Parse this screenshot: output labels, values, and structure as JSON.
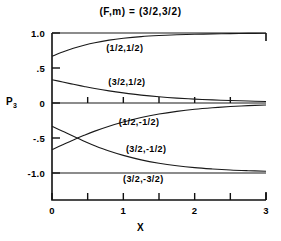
{
  "figure": {
    "title": "(F,m) = (3/2,3/2)",
    "y_axis_title": "P",
    "y_axis_title_sub": "3",
    "x_axis_title": "X"
  },
  "chart_data": {
    "type": "line",
    "title": "(F,m) = (3/2,3/2)",
    "xlabel": "X",
    "ylabel": "P3",
    "xlim": [
      0,
      3
    ],
    "ylim": [
      -1.15,
      1.05
    ],
    "grid": false,
    "legend": "inline-curve-labels",
    "xticks": [
      0,
      0.5,
      1,
      1.5,
      2,
      2.5,
      3
    ],
    "xticklabels": [
      "0",
      "",
      "1",
      "",
      "2",
      "",
      "3"
    ],
    "yticks": [
      1.0,
      0.5,
      0,
      -0.5,
      -1.0
    ],
    "yticklabels": [
      "1.0",
      ".5",
      "0",
      "-.5",
      "-1.0"
    ],
    "x": [
      0,
      0.15,
      0.3,
      0.45,
      0.6,
      0.8,
      1.0,
      1.25,
      1.5,
      1.75,
      2.0,
      2.25,
      2.5,
      2.75,
      3.0
    ],
    "series": [
      {
        "name": "(1/2,1/2)",
        "label": "(1/2,1/2)",
        "values": [
          0.667,
          0.728,
          0.781,
          0.825,
          0.861,
          0.898,
          0.924,
          0.948,
          0.964,
          0.975,
          0.982,
          0.987,
          0.991,
          0.994,
          0.996
        ],
        "label_x": 1.02,
        "label_y": 0.78
      },
      {
        "name": "(3/2,1/2)",
        "label": "(3/2,1/2)",
        "values": [
          0.333,
          0.3,
          0.267,
          0.236,
          0.207,
          0.173,
          0.144,
          0.113,
          0.089,
          0.07,
          0.055,
          0.044,
          0.035,
          0.028,
          0.022
        ],
        "label_x": 1.05,
        "label_y": 0.3
      },
      {
        "name": "(1/2,-1/2)",
        "label": "(1/2,-1/2)",
        "values": [
          -0.667,
          -0.596,
          -0.527,
          -0.462,
          -0.402,
          -0.332,
          -0.272,
          -0.208,
          -0.158,
          -0.12,
          -0.09,
          -0.068,
          -0.051,
          -0.038,
          -0.029
        ],
        "label_x": 1.22,
        "label_y": -0.27
      },
      {
        "name": "(3/2,-1/2)",
        "label": "(3/2,-1/2)",
        "values": [
          -0.333,
          -0.404,
          -0.476,
          -0.545,
          -0.61,
          -0.686,
          -0.748,
          -0.812,
          -0.86,
          -0.896,
          -0.923,
          -0.942,
          -0.957,
          -0.967,
          -0.975
        ],
        "label_x": 1.32,
        "label_y": -0.66
      },
      {
        "name": "(3/2,-3/2)",
        "label": "(3/2,-3/2)",
        "values": [
          -1.0,
          -1.0,
          -1.0,
          -1.0,
          -1.0,
          -1.0,
          -1.0,
          -1.0,
          -1.0,
          -1.0,
          -1.0,
          -1.0,
          -1.0,
          -1.0,
          -1.0
        ],
        "label_x": 1.28,
        "label_y": -1.09
      },
      {
        "name": "upper-bound-line",
        "label": "",
        "values": [
          1.0,
          1.0,
          1.0,
          1.0,
          1.0,
          1.0,
          1.0,
          1.0,
          1.0,
          1.0,
          1.0,
          1.0,
          1.0,
          1.0,
          1.0
        ],
        "label_x": null,
        "label_y": null
      },
      {
        "name": "zero-line",
        "label": "",
        "values": [
          0,
          0,
          0,
          0,
          0,
          0,
          0,
          0,
          0,
          0,
          0,
          0,
          0,
          0,
          0
        ],
        "label_x": null,
        "label_y": null
      }
    ]
  }
}
